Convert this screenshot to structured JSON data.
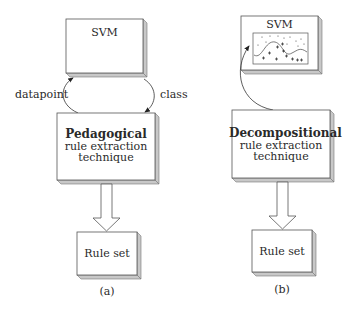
{
  "panel_a": {
    "svm_label": "SVM",
    "technique_title": "Pedagogical",
    "technique_line2": "rule extraction",
    "technique_line3": "technique",
    "left_arrow_label": "datapoint",
    "right_arrow_label": "class",
    "output_label": "Rule set",
    "caption": "(a)"
  },
  "panel_b": {
    "svm_label": "SVM",
    "technique_title": "Decompositional",
    "technique_line2": "rule extraction",
    "technique_line3": "technique",
    "output_label": "Rule set",
    "caption": "(b)"
  },
  "colors": {
    "box_border": "#555555",
    "box_shade": "#c8c8c8",
    "text": "#2a2a2a"
  }
}
